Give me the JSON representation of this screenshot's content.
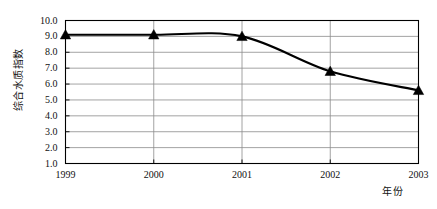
{
  "chart_data": {
    "type": "line",
    "title": "",
    "xlabel": "年份",
    "ylabel": "综合水质指数",
    "categories": [
      "1999",
      "2000",
      "2001",
      "2002",
      "2003"
    ],
    "values": [
      9.1,
      9.1,
      9.0,
      6.8,
      5.6
    ],
    "series": [
      {
        "name": "综合水质指数",
        "values": [
          9.1,
          9.1,
          9.0,
          6.8,
          5.6
        ],
        "marker": "triangle",
        "marker_color": "#000000",
        "line_color": "#000000",
        "smooth": true
      }
    ],
    "ylim": [
      1.0,
      10.0
    ],
    "ytick_labels": [
      "10.0",
      "9.0",
      "8.0",
      "7.0",
      "6.0",
      "5.0",
      "4.0",
      "3.0",
      "2.0",
      "1.0"
    ],
    "ytick_values": [
      10.0,
      9.0,
      8.0,
      7.0,
      6.0,
      5.0,
      4.0,
      3.0,
      2.0,
      1.0
    ],
    "xtick_labels": [
      "1999",
      "2000",
      "2001",
      "2002",
      "2003"
    ],
    "grid": {
      "horizontal": true,
      "vertical": true,
      "color": "#8c8c8c"
    },
    "legend": {
      "visible": false,
      "position": "none"
    },
    "frame": {
      "visible": true,
      "color": "#000000"
    },
    "background": "#ffffff"
  }
}
